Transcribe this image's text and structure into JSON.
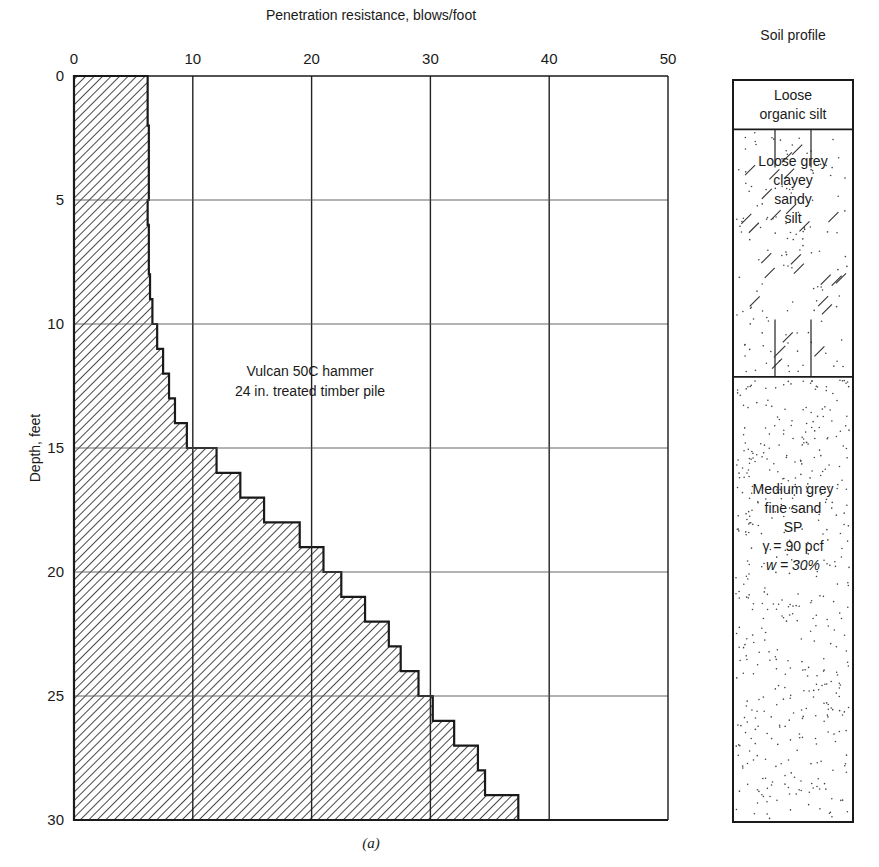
{
  "chart_data": {
    "type": "bar",
    "orientation": "horizontal-step",
    "title": "Penetration resistance, blows/foot",
    "xlabel": "Penetration resistance, blows/foot",
    "ylabel": "Depth, feet",
    "xlim": [
      0,
      50
    ],
    "ylim": [
      0,
      30
    ],
    "y_inverted": true,
    "grid": true,
    "x_ticks": [
      0,
      10,
      20,
      30,
      40,
      50
    ],
    "y_ticks": [
      0,
      5,
      10,
      15,
      20,
      25,
      30
    ],
    "depth_intervals_ft": [
      [
        0,
        1
      ],
      [
        1,
        2
      ],
      [
        2,
        3
      ],
      [
        3,
        4
      ],
      [
        4,
        5
      ],
      [
        5,
        6
      ],
      [
        6,
        7
      ],
      [
        7,
        8
      ],
      [
        8,
        9
      ],
      [
        9,
        10
      ],
      [
        10,
        11
      ],
      [
        11,
        12
      ],
      [
        12,
        13
      ],
      [
        13,
        14
      ],
      [
        14,
        15
      ],
      [
        15,
        16
      ],
      [
        16,
        17
      ],
      [
        17,
        18
      ],
      [
        18,
        19
      ],
      [
        19,
        20
      ],
      [
        20,
        21
      ],
      [
        21,
        22
      ],
      [
        22,
        23
      ],
      [
        23,
        24
      ],
      [
        24,
        25
      ],
      [
        25,
        26
      ],
      [
        26,
        27
      ],
      [
        27,
        28
      ],
      [
        28,
        29
      ],
      [
        29,
        30
      ]
    ],
    "values": [
      6.2,
      6.2,
      6.3,
      6.3,
      6.3,
      6.2,
      6.3,
      6.3,
      6.4,
      6.6,
      7,
      7.5,
      8,
      8.5,
      9.5,
      12,
      14,
      16,
      19,
      21,
      22.5,
      24.5,
      26.5,
      27.5,
      29,
      30.2,
      32,
      34,
      34.6,
      37.4
    ],
    "annotation": [
      "Vulcan 50C hammer",
      "24 in. treated timber pile"
    ],
    "caption": "(a)"
  },
  "soil_profile": {
    "title": "Soil profile",
    "layers": [
      {
        "top_ft": 0,
        "bottom_ft": 2,
        "lines": [
          "Loose",
          "organic silt"
        ],
        "pattern": "none"
      },
      {
        "top_ft": 2,
        "bottom_ft": 12,
        "lines": [
          "Loose grey",
          "clayey",
          "sandy",
          "silt"
        ],
        "pattern": "dots-slashes"
      },
      {
        "top_ft": 12,
        "bottom_ft": 30,
        "lines": [
          "Medium grey",
          "fine sand",
          "SP",
          "γ = 90 pcf",
          "w  =  30%"
        ],
        "pattern": "dots"
      }
    ]
  },
  "colors": {
    "ink": "#1a1a1a",
    "grid": "#333333",
    "background": "#ffffff"
  }
}
